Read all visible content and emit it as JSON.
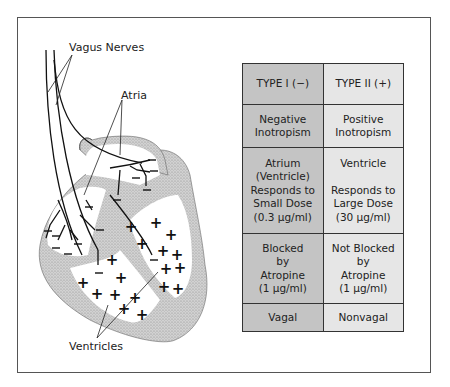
{
  "diagram": {
    "labels": {
      "vagus_nerves": "Vagus Nerves",
      "atria": "Atria",
      "ventricles": "Ventricles"
    },
    "signs": {
      "atria_sign": "−",
      "ventricle_sign": "+"
    }
  },
  "table": {
    "headers": [
      "TYPE I (−)",
      "TYPE II (+)"
    ],
    "rows": [
      {
        "type1": [
          "Negative",
          "Inotropism"
        ],
        "type2": [
          "Positive",
          "Inotropism"
        ]
      },
      {
        "type1": [
          "Atrium",
          "(Ventricle)",
          "Responds to",
          "Small Dose",
          "(0.3 µg/ml)"
        ],
        "type2": [
          "Ventricle",
          "",
          "Responds to",
          "Large Dose",
          "(30 µg/ml)"
        ]
      },
      {
        "type1": [
          "Blocked",
          "by",
          "Atropine",
          "(1 µg/ml)"
        ],
        "type2": [
          "Not Blocked",
          "by",
          "Atropine",
          "(1 µg/ml)"
        ]
      },
      {
        "type1": [
          "Vagal"
        ],
        "type2": [
          "Nonvagal"
        ]
      }
    ]
  },
  "colors": {
    "type1_fill": "#c4c4c4",
    "type2_fill": "#e6e6e6",
    "wall_stipple": "#bdbdbd",
    "line": "#111111"
  }
}
